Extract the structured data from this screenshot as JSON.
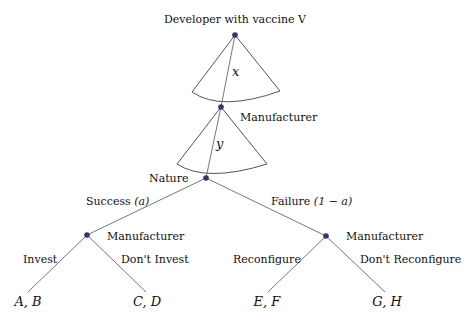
{
  "diagram": {
    "type": "game-tree",
    "colors": {
      "node": "#2b3a6b",
      "edge": "#777777",
      "fan": "#555555",
      "text": "#111111"
    },
    "nodes": {
      "developer": {
        "label": "Developer with vaccine V",
        "x": 235,
        "y": 35
      },
      "manufacturer_top": {
        "label": "Manufacturer",
        "x": 221,
        "y": 107
      },
      "nature": {
        "label": "Nature",
        "x": 206,
        "y": 178
      },
      "manufacturer_left": {
        "label": "Manufacturer",
        "x": 87,
        "y": 235
      },
      "manufacturer_right": {
        "label": "Manufacturer",
        "x": 326,
        "y": 236
      }
    },
    "continuous_choices": {
      "developer": {
        "variable": "x"
      },
      "manufacturer": {
        "variable": "y"
      }
    },
    "branches": {
      "success": {
        "label": "Success ",
        "prob": "(a)"
      },
      "failure": {
        "label": "Failure ",
        "prob": "(1 − a)"
      },
      "invest": {
        "label": "Invest"
      },
      "dont_invest": {
        "label": "Don't Invest"
      },
      "reconfigure": {
        "label": "Reconfigure"
      },
      "dont_reconfigure": {
        "label": "Don't Reconfigure"
      }
    },
    "payoffs": {
      "ab": "A, B",
      "cd": "C, D",
      "ef": "E, F",
      "gh": "G, H"
    }
  }
}
